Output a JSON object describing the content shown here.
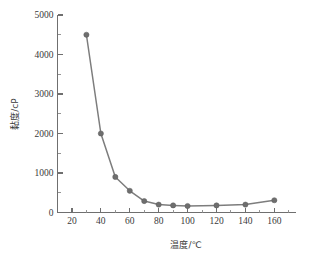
{
  "chart_data": {
    "type": "line",
    "title": "",
    "subtitle": "",
    "xlabel": "温度/℃",
    "ylabel": "黏度/cP",
    "xlim": [
      10,
      175
    ],
    "ylim": [
      0,
      5000
    ],
    "grid": false,
    "legend": false,
    "legend_position": "none",
    "x_ticks": [
      20,
      40,
      60,
      80,
      100,
      120,
      140,
      160
    ],
    "x_tick_labels": [
      "20",
      "40",
      "60",
      "80",
      "100",
      "120",
      "140",
      "160"
    ],
    "x_minor_ticks": [
      30,
      50,
      70,
      90,
      110,
      130,
      150,
      170
    ],
    "y_ticks": [
      0,
      1000,
      2000,
      3000,
      4000,
      5000
    ],
    "y_tick_labels": [
      "0",
      "1000",
      "2000",
      "3000",
      "4000",
      "5000"
    ],
    "y_minor_ticks": [
      500,
      1500,
      2500,
      3500,
      4500
    ],
    "x": [
      30,
      40,
      50,
      60,
      70,
      80,
      90,
      100,
      120,
      140,
      160
    ],
    "values": [
      4500,
      2000,
      900,
      550,
      290,
      200,
      180,
      165,
      180,
      200,
      310
    ],
    "series": [
      {
        "name": "黏度",
        "x": [
          30,
          40,
          50,
          60,
          70,
          80,
          90,
          100,
          120,
          140,
          160
        ],
        "values": [
          4500,
          2000,
          900,
          550,
          290,
          200,
          180,
          165,
          180,
          200,
          310
        ],
        "marker": "circle",
        "marker_color": "#6e6e6e",
        "line_color": "#7d7d7d"
      }
    ],
    "annotations": []
  },
  "colors": {
    "background": "#ffffff",
    "axis": "#6f6f6f",
    "text": "#3a3a3a",
    "series": "#7d7d7d",
    "marker": "#6e6e6e"
  }
}
